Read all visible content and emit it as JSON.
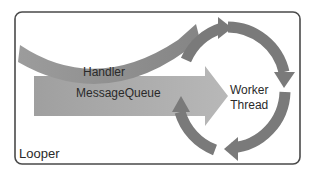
{
  "diagram": {
    "container": {
      "label": "Looper"
    },
    "handler": {
      "label": "Handler"
    },
    "message_queue": {
      "label": "MessageQueue"
    },
    "worker_thread": {
      "line1": "Worker",
      "line2": "Thread"
    }
  },
  "colors": {
    "border": "#4a4a4a",
    "arrow_dark": "#7a7a7a",
    "arrow_light": "#a8a8a8",
    "text": "#2a2a2a",
    "background": "#ffffff"
  }
}
